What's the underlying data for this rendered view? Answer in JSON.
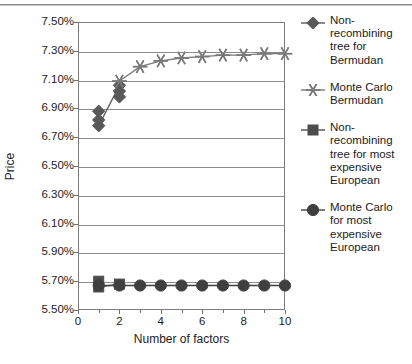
{
  "chart_data": {
    "type": "line",
    "title": "",
    "xlabel": "Number of factors",
    "ylabel": "Price",
    "xlim": [
      0,
      10
    ],
    "ylim": [
      0.055,
      0.075
    ],
    "ytick_labels": [
      "7.50%",
      "7.30%",
      "7.10%",
      "6.90%",
      "6.70%",
      "6.50%",
      "6.30%",
      "6.10%",
      "5.90%",
      "5.70%",
      "5.50%"
    ],
    "ytick_values": [
      0.075,
      0.073,
      0.071,
      0.069,
      0.067,
      0.065,
      0.063,
      0.061,
      0.059,
      0.057,
      0.055
    ],
    "xtick_labels": [
      "0",
      "2",
      "4",
      "6",
      "8",
      "10"
    ],
    "xtick_values": [
      0,
      2,
      4,
      6,
      8,
      10
    ],
    "xtick_minor_values": [
      1,
      3,
      5,
      7,
      9
    ],
    "grid": "horizontal",
    "legend_position": "right",
    "series": [
      {
        "name": "Non-recombining tree for Bermudan",
        "marker": "diamond",
        "color": "#595959",
        "x": [
          1,
          1,
          1,
          2,
          2,
          2
        ],
        "values": [
          0.0688,
          0.0682,
          0.0678,
          0.0706,
          0.0702,
          0.0698
        ]
      },
      {
        "name": "Monte Carlo Bermudan",
        "marker": "star",
        "color": "#7a7a7a",
        "x": [
          2,
          3,
          4,
          5,
          6,
          7,
          8,
          9,
          10
        ],
        "values": [
          0.0709,
          0.0719,
          0.0723,
          0.0725,
          0.0726,
          0.0727,
          0.0727,
          0.0728,
          0.0728
        ]
      },
      {
        "name": "Non-recombining tree for most expensive European",
        "marker": "square",
        "color": "#4d4d4d",
        "x": [
          1,
          1,
          2
        ],
        "values": [
          0.057,
          0.0566,
          0.0568
        ]
      },
      {
        "name": "Monte Carlo for most expensive European",
        "marker": "circle",
        "color": "#3f3f3f",
        "x": [
          1,
          2,
          3,
          4,
          5,
          6,
          7,
          8,
          9,
          10
        ],
        "values": [
          0.0567,
          0.0567,
          0.0567,
          0.0567,
          0.0567,
          0.0567,
          0.0567,
          0.0567,
          0.0567,
          0.0567
        ]
      }
    ]
  },
  "legend": {
    "entries": [
      {
        "label": "Non-recombining tree for Bermudan",
        "marker": "diamond"
      },
      {
        "label": "Monte Carlo Bermudan",
        "marker": "star"
      },
      {
        "label": "Non-recombining tree for most expensive European",
        "marker": "square"
      },
      {
        "label": "Monte Carlo for most expensive European",
        "marker": "circle"
      }
    ]
  }
}
